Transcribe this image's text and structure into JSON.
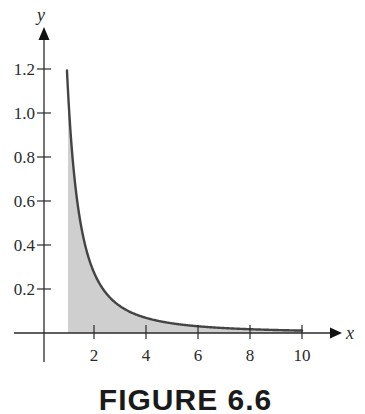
{
  "chart_data": {
    "type": "area",
    "title": "",
    "caption": "FIGURE 6.6",
    "xlabel": "x",
    "ylabel": "y",
    "xlim": [
      0,
      11
    ],
    "ylim": [
      0,
      1.3
    ],
    "x_ticks": [
      2,
      4,
      6,
      8,
      10
    ],
    "x_tick_labels": [
      "2",
      "4",
      "6",
      "8",
      "10"
    ],
    "y_ticks": [
      0.2,
      0.4,
      0.6,
      0.8,
      1.0,
      1.2
    ],
    "y_tick_labels": [
      "0.2",
      "0.4",
      "0.6",
      "0.8",
      "1.0",
      "1.2"
    ],
    "grid": false,
    "legend": null,
    "series": [
      {
        "name": "curve",
        "description": "decreasing curve approximately y = k/x^2, shaded region under curve from x = 1 to x = 10",
        "x": [
          0.96,
          1,
          1.1,
          1.2,
          1.3,
          1.4,
          1.5,
          1.7,
          2,
          2.5,
          3,
          3.5,
          4,
          5,
          6,
          7,
          8,
          9,
          10
        ],
        "values": [
          1.19,
          1.1,
          0.91,
          0.76,
          0.65,
          0.56,
          0.49,
          0.38,
          0.28,
          0.18,
          0.12,
          0.09,
          0.07,
          0.04,
          0.03,
          0.02,
          0.02,
          0.01,
          0.01
        ]
      }
    ],
    "shaded_region": {
      "x_from": 1,
      "x_to": 10,
      "color": "#cfcfcf"
    },
    "colors": {
      "curve": "#444444",
      "fill": "#cfcfcf",
      "axes": "#2a2a2a"
    }
  }
}
